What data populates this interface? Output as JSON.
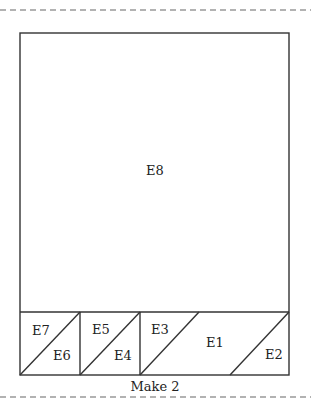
{
  "diagram": {
    "pieces": [
      {
        "id": "E8",
        "label": "E8"
      },
      {
        "id": "E7",
        "label": "E7"
      },
      {
        "id": "E6",
        "label": "E6"
      },
      {
        "id": "E5",
        "label": "E5"
      },
      {
        "id": "E4",
        "label": "E4"
      },
      {
        "id": "E3",
        "label": "E3"
      },
      {
        "id": "E1",
        "label": "E1"
      },
      {
        "id": "E2",
        "label": "E2"
      }
    ],
    "caption": "Make 2",
    "colors": {
      "line": "#333333",
      "dash": "#666666",
      "text": "#222222",
      "background": "#ffffff"
    }
  }
}
